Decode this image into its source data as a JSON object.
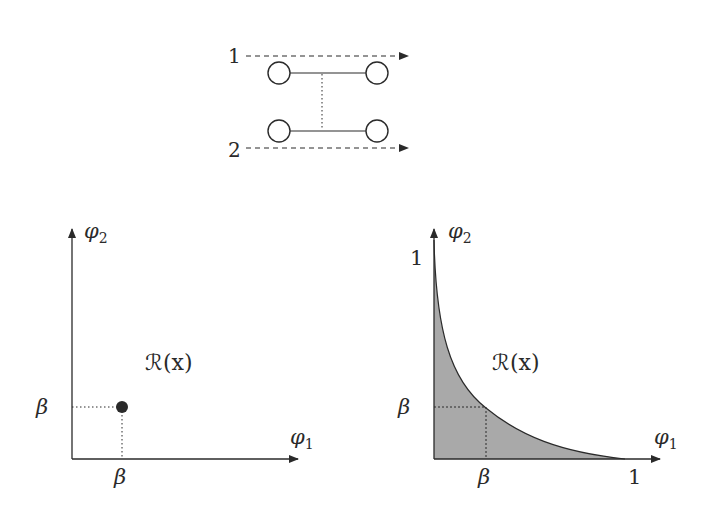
{
  "colors": {
    "ink": "#2a2a2a",
    "fill": "#a9a9a9",
    "background": "#ffffff"
  },
  "top_diagram": {
    "path_labels": [
      "1",
      "2"
    ],
    "nodes": 4
  },
  "left_plot": {
    "x_axis_label": "φ",
    "x_axis_sub": "1",
    "y_axis_label": "φ",
    "y_axis_sub": "2",
    "region_label": "ℛ(x)",
    "x_tick": "β",
    "y_tick": "β"
  },
  "right_plot": {
    "x_axis_label": "φ",
    "x_axis_sub": "1",
    "y_axis_label": "φ",
    "y_axis_sub": "2",
    "region_label": "ℛ(x)",
    "x_tick_beta": "β",
    "y_tick_beta": "β",
    "x_tick_one": "1",
    "y_tick_one": "1"
  }
}
